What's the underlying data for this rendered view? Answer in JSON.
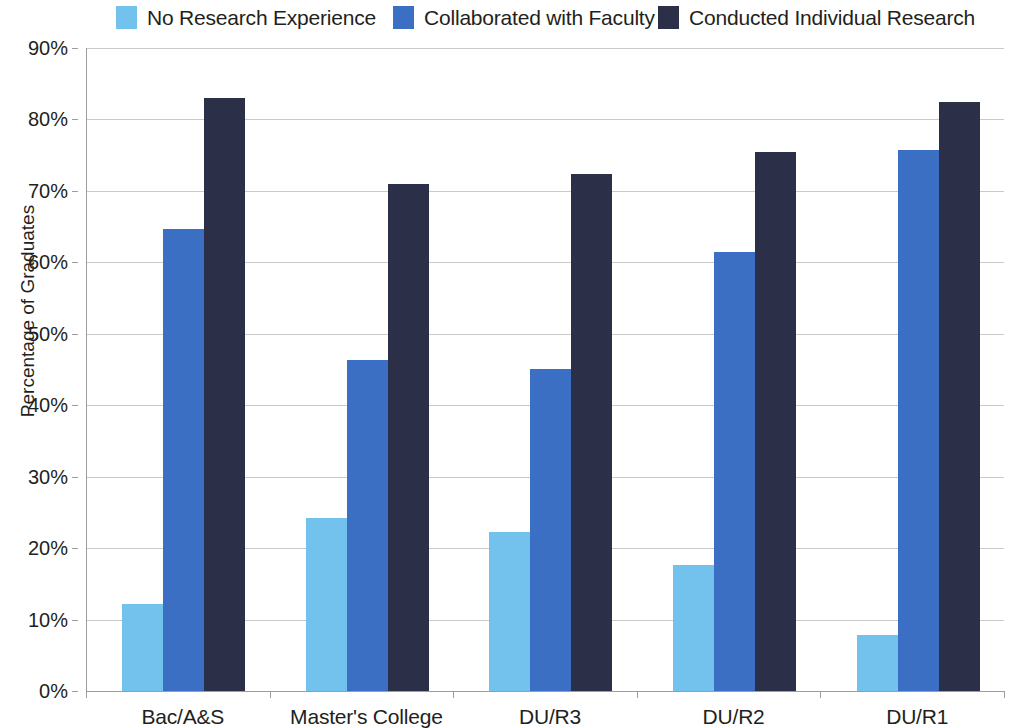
{
  "chart_data": {
    "type": "bar",
    "title": "",
    "subtitle": "",
    "xlabel": "",
    "ylabel": "Percentage of Graduates",
    "categories": [
      "Bac/A&S",
      "Master's College",
      "DU/R3",
      "DU/R2",
      "DU/R1"
    ],
    "series": [
      {
        "name": "No Research Experience",
        "color": "#73C2EE",
        "values": [
          12.2,
          24.2,
          22.3,
          17.7,
          7.8
        ]
      },
      {
        "name": "Collaborated with Faculty",
        "color": "#3A6FC4",
        "values": [
          64.6,
          46.4,
          45.1,
          61.5,
          75.7
        ]
      },
      {
        "name": "Conducted Individual Research",
        "color": "#2B3048",
        "values": [
          83.0,
          70.9,
          72.3,
          75.4,
          82.4
        ]
      }
    ],
    "ylim": [
      0,
      90
    ],
    "ytick_values": [
      0,
      10,
      20,
      30,
      40,
      50,
      60,
      70,
      80,
      90
    ],
    "ytick_labels": [
      "0%",
      "10%",
      "20%",
      "30%",
      "40%",
      "50%",
      "60%",
      "70%",
      "80%",
      "90%"
    ],
    "grid": true,
    "grid_axis": "y",
    "legend_position": "top",
    "value_suffix": "%"
  }
}
